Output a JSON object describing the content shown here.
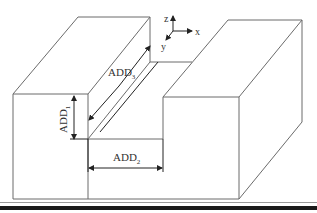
{
  "figure": {
    "type": "isometric-groove-diagram",
    "axes": {
      "x_label": "x",
      "y_label": "y",
      "z_label": "z"
    },
    "dimensions": [
      {
        "id": "ADD1",
        "base": "ADD",
        "subscript": "1",
        "orientation": "vertical",
        "meaning": "groove depth"
      },
      {
        "id": "ADD2",
        "base": "ADD",
        "subscript": "2",
        "orientation": "horizontal",
        "meaning": "groove width"
      },
      {
        "id": "ADD3",
        "base": "ADD",
        "subscript": "3",
        "orientation": "diagonal",
        "meaning": "groove length"
      }
    ],
    "colors": {
      "edge": "#6b6b6b",
      "dimension": "#222222",
      "text": "#333333",
      "background": "#ffffff",
      "rule": "#1a1a1a"
    }
  }
}
